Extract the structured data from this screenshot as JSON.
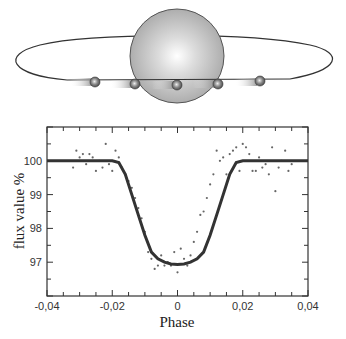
{
  "diagram": {
    "star": {
      "label": "",
      "color": "#b8b8b8"
    },
    "orbit": {
      "color": "#333333"
    },
    "planet_positions": 5
  },
  "chart_data": {
    "type": "scatter",
    "title": "",
    "xlabel": "Phase",
    "ylabel": "flux value %",
    "xlim": [
      -0.04,
      0.04
    ],
    "ylim": [
      96,
      101
    ],
    "x_ticks": [
      "-0,04",
      "-0,02",
      "0",
      "0,02",
      "0,04"
    ],
    "y_ticks": [
      "97",
      "98",
      "99",
      "100"
    ],
    "grid": false,
    "legend": null,
    "series": [
      {
        "name": "model transit curve",
        "style": "line",
        "x": [
          -0.04,
          -0.03,
          -0.02,
          -0.018,
          -0.016,
          -0.014,
          -0.012,
          -0.01,
          -0.008,
          -0.006,
          -0.004,
          -0.002,
          0,
          0.002,
          0.004,
          0.006,
          0.008,
          0.01,
          0.012,
          0.014,
          0.016,
          0.018,
          0.02,
          0.03,
          0.04
        ],
        "values": [
          100,
          100,
          100,
          99.95,
          99.6,
          99.0,
          98.4,
          97.8,
          97.3,
          97.1,
          97.0,
          96.95,
          96.93,
          96.95,
          97.0,
          97.1,
          97.3,
          97.8,
          98.4,
          99.0,
          99.6,
          99.95,
          100,
          100,
          100
        ]
      },
      {
        "name": "observed data",
        "style": "points",
        "x": [
          -0.032,
          -0.031,
          -0.03,
          -0.029,
          -0.028,
          -0.027,
          -0.026,
          -0.025,
          -0.024,
          -0.023,
          -0.022,
          -0.021,
          -0.02,
          -0.019,
          -0.018,
          -0.017,
          -0.016,
          -0.015,
          -0.014,
          -0.013,
          -0.012,
          -0.011,
          -0.01,
          -0.009,
          -0.008,
          -0.007,
          -0.006,
          -0.005,
          -0.004,
          -0.003,
          -0.002,
          -0.001,
          0,
          0.001,
          0.002,
          0.003,
          0.004,
          0.005,
          0.006,
          0.007,
          0.008,
          0.009,
          0.01,
          0.011,
          0.012,
          0.013,
          0.014,
          0.015,
          0.016,
          0.017,
          0.018,
          0.019,
          0.02,
          0.021,
          0.022,
          0.023,
          0.024,
          0.025,
          0.026,
          0.027,
          0.028,
          0.029,
          0.03,
          0.031,
          0.032,
          0.033,
          0.034,
          0.035
        ],
        "values": [
          99.8,
          100.3,
          100.1,
          100.2,
          99.9,
          100.2,
          100.1,
          99.7,
          100.0,
          99.8,
          100.5,
          99.9,
          99.7,
          100.3,
          100.1,
          99.8,
          99.6,
          99.4,
          99.2,
          98.9,
          98.6,
          98.3,
          97.9,
          97.3,
          97.1,
          96.8,
          96.9,
          97.2,
          96.9,
          97.0,
          96.9,
          97.3,
          96.7,
          97.4,
          97.1,
          96.9,
          97.2,
          97.6,
          97.9,
          98.4,
          98.5,
          98.9,
          99.3,
          99.6,
          100.3,
          100.0,
          100.1,
          99.6,
          100.2,
          100.3,
          100.4,
          99.7,
          100.5,
          100.4,
          100.2,
          99.7,
          99.7,
          100.1,
          99.8,
          99.9,
          99.6,
          100.4,
          99.1,
          99.8,
          100.0,
          100.3,
          99.7,
          99.9
        ]
      }
    ]
  }
}
